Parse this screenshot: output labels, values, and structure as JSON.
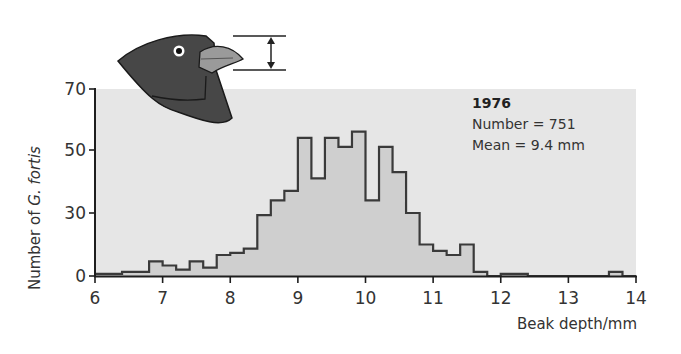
{
  "chart_data": {
    "type": "bar",
    "subtype": "histogram",
    "title": "",
    "xlabel": "Beak depth/mm",
    "ylabel_prefix": "Number of ",
    "ylabel_species": "G. fortis",
    "ylabel": "Number of G. fortis",
    "xlim": [
      6,
      14
    ],
    "ylim": [
      0,
      70
    ],
    "x_ticks": [
      6,
      7,
      8,
      9,
      10,
      11,
      12,
      13,
      14
    ],
    "y_ticks": [
      0,
      30,
      50,
      70
    ],
    "grid": false,
    "legend_position": "upper right",
    "bin_width": 0.2,
    "bins": [
      {
        "x": 6.0,
        "count": 1
      },
      {
        "x": 6.2,
        "count": 1
      },
      {
        "x": 6.4,
        "count": 2
      },
      {
        "x": 6.6,
        "count": 2
      },
      {
        "x": 6.8,
        "count": 7
      },
      {
        "x": 7.0,
        "count": 5
      },
      {
        "x": 7.2,
        "count": 3
      },
      {
        "x": 7.4,
        "count": 7
      },
      {
        "x": 7.6,
        "count": 4
      },
      {
        "x": 7.8,
        "count": 10
      },
      {
        "x": 8.0,
        "count": 11
      },
      {
        "x": 8.2,
        "count": 13
      },
      {
        "x": 8.4,
        "count": 29
      },
      {
        "x": 8.6,
        "count": 34
      },
      {
        "x": 8.8,
        "count": 37
      },
      {
        "x": 9.0,
        "count": 54
      },
      {
        "x": 9.2,
        "count": 41
      },
      {
        "x": 9.4,
        "count": 54
      },
      {
        "x": 9.6,
        "count": 51
      },
      {
        "x": 9.8,
        "count": 56
      },
      {
        "x": 10.0,
        "count": 34
      },
      {
        "x": 10.2,
        "count": 51
      },
      {
        "x": 10.4,
        "count": 43
      },
      {
        "x": 10.6,
        "count": 30
      },
      {
        "x": 10.8,
        "count": 15
      },
      {
        "x": 11.0,
        "count": 12
      },
      {
        "x": 11.2,
        "count": 10
      },
      {
        "x": 11.4,
        "count": 15
      },
      {
        "x": 11.6,
        "count": 2
      },
      {
        "x": 11.8,
        "count": 0
      },
      {
        "x": 12.0,
        "count": 1
      },
      {
        "x": 12.2,
        "count": 1
      },
      {
        "x": 12.4,
        "count": 0
      },
      {
        "x": 12.6,
        "count": 0
      },
      {
        "x": 12.8,
        "count": 0
      },
      {
        "x": 13.0,
        "count": 0
      },
      {
        "x": 13.2,
        "count": 0
      },
      {
        "x": 13.4,
        "count": 0
      },
      {
        "x": 13.6,
        "count": 2
      },
      {
        "x": 13.8,
        "count": 0
      }
    ],
    "annotation": {
      "year": "1976",
      "number_line": "Number = 751",
      "mean_line": "Mean = 9.4 mm"
    },
    "illustration": "finch-head-beak-depth-icon"
  },
  "colors": {
    "panel_bg": "#e6e6e6",
    "bar_fill": "#cfcfcf",
    "bar_stroke": "#3a3a3a",
    "axis": "#1e1e1e",
    "bird_body": "#4a4a4a",
    "bird_beak": "#9a9a9a"
  }
}
